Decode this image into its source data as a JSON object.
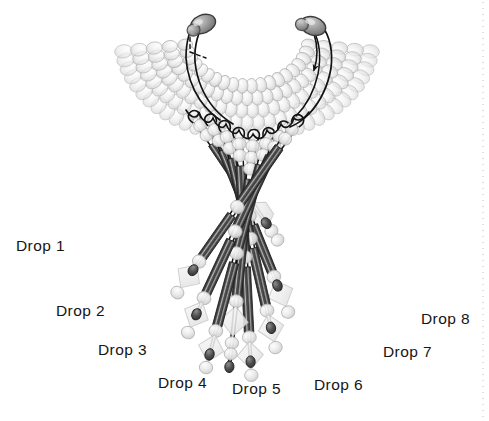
{
  "figure": {
    "width": 489,
    "height": 421,
    "background_color": "#ffffff"
  },
  "labels": [
    {
      "id": "drop-1",
      "text": "Drop 1",
      "x": 16,
      "y": 238,
      "anchor": "start"
    },
    {
      "id": "drop-2",
      "text": "Drop 2",
      "x": 56,
      "y": 303,
      "anchor": "start"
    },
    {
      "id": "drop-3",
      "text": "Drop 3",
      "x": 98,
      "y": 342,
      "anchor": "start"
    },
    {
      "id": "drop-4",
      "text": "Drop 4",
      "x": 158,
      "y": 375,
      "anchor": "start"
    },
    {
      "id": "drop-5",
      "text": "Drop 5",
      "x": 232,
      "y": 381,
      "anchor": "start"
    },
    {
      "id": "drop-6",
      "text": "Drop 6",
      "x": 314,
      "y": 377,
      "anchor": "start"
    },
    {
      "id": "drop-7",
      "text": "Drop 7",
      "x": 383,
      "y": 344,
      "anchor": "start"
    },
    {
      "id": "drop-8",
      "text": "Drop 8",
      "x": 421,
      "y": 311,
      "anchor": "start"
    }
  ],
  "colors": {
    "bugle_bead_dark": "#3a3a3a",
    "bugle_bead_mid": "#6a6a6a",
    "bugle_bead_highlight": "#cfcfcf",
    "seed_bead_fill": "#e4e4e4",
    "seed_bead_stroke": "#b6b6b6",
    "diamond_bead_fill": "#efefef",
    "diamond_bead_stroke": "#c9c9c9",
    "end_bead_dark": "#4a4a4a",
    "thread": "#121212",
    "clasp_bead": "#8f8f8f",
    "label_text": "#161616",
    "dotted_rule": "#c8c8c8"
  },
  "collar": {
    "description": "U-shaped multi-row seed bead collar",
    "center_x": 247,
    "center_y": 38,
    "rows": 5,
    "row_radii": [
      48,
      60,
      72,
      84,
      96
    ],
    "beads_per_row": [
      20,
      23,
      26,
      29,
      32
    ],
    "arc_start_deg": 8,
    "arc_end_deg": 172
  },
  "drops": [
    {
      "id": "drop-1",
      "label": "Drop 1",
      "angle_deg": 236,
      "origin_x": 198,
      "origin_y": 122,
      "length": 118,
      "segments": [
        "seed",
        "seed",
        "bugle-long",
        "seed",
        "seed",
        "hex",
        "seed",
        "seed",
        "end"
      ],
      "bugle_count": 1,
      "has_hex_bead": true,
      "has_diamond_bead": false
    },
    {
      "id": "drop-2",
      "label": "Drop 2",
      "angle_deg": 248,
      "origin_x": 213,
      "origin_y": 126,
      "length": 168,
      "segments": [
        "seed",
        "seed",
        "bugle-long",
        "seed",
        "diamond",
        "seed",
        "bugle-long",
        "seed",
        "end"
      ],
      "bugle_count": 2,
      "has_hex_bead": false,
      "has_diamond_bead": true
    },
    {
      "id": "drop-3",
      "label": "Drop 3",
      "angle_deg": 257,
      "origin_x": 226,
      "origin_y": 133,
      "length": 196,
      "segments": [
        "seed",
        "seed",
        "bugle-long",
        "seed",
        "diamond",
        "seed",
        "bugle-long",
        "seed",
        "end"
      ],
      "bugle_count": 2,
      "has_hex_bead": false,
      "has_diamond_bead": true
    },
    {
      "id": "drop-4",
      "label": "Drop 4",
      "angle_deg": 267,
      "origin_x": 239,
      "origin_y": 140,
      "length": 218,
      "segments": [
        "seed",
        "seed",
        "bugle-long",
        "seed",
        "diamond",
        "seed",
        "bugle-long",
        "seed",
        "end"
      ],
      "bugle_count": 2,
      "has_hex_bead": false,
      "has_diamond_bead": true
    },
    {
      "id": "drop-5",
      "label": "Drop 5",
      "angle_deg": 276,
      "origin_x": 253,
      "origin_y": 142,
      "length": 228,
      "segments": [
        "seed",
        "seed",
        "seed",
        "bugle-long",
        "seed",
        "diamond",
        "seed",
        "end"
      ],
      "bugle_count": 1,
      "has_hex_bead": false,
      "has_diamond_bead": true
    },
    {
      "id": "drop-6",
      "label": "Drop 6",
      "angle_deg": 285,
      "origin_x": 267,
      "origin_y": 140,
      "length": 218,
      "segments": [
        "seed",
        "seed",
        "bugle-long",
        "seed",
        "diamond",
        "seed",
        "bugle-long",
        "seed",
        "end"
      ],
      "bugle_count": 2,
      "has_hex_bead": false,
      "has_diamond_bead": true
    },
    {
      "id": "drop-7",
      "label": "Drop 7",
      "angle_deg": 295,
      "origin_x": 281,
      "origin_y": 133,
      "length": 196,
      "segments": [
        "seed",
        "seed",
        "bugle-long",
        "seed",
        "diamond",
        "seed",
        "bugle-long",
        "seed",
        "end"
      ],
      "bugle_count": 2,
      "has_hex_bead": false,
      "has_diamond_bead": true
    },
    {
      "id": "drop-8",
      "label": "Drop 8",
      "angle_deg": 305,
      "origin_x": 294,
      "origin_y": 126,
      "length": 172,
      "segments": [
        "seed",
        "seed",
        "bugle-long",
        "seed",
        "diamond",
        "seed",
        "end"
      ],
      "bugle_count": 2,
      "has_hex_bead": false,
      "has_diamond_bead": true
    }
  ],
  "clasps": {
    "left": {
      "x": 203,
      "y": 24,
      "has_dashed_thread": true
    },
    "right": {
      "x": 313,
      "y": 26,
      "has_arrow": true,
      "arrow_direction": "down"
    }
  },
  "dotted_rule": {
    "x": 483,
    "y_start": 2,
    "y_end": 419,
    "dash": "1 5"
  }
}
